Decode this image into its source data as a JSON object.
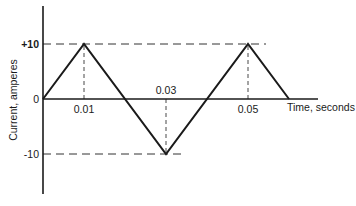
{
  "chart_data": {
    "type": "line",
    "title": "",
    "xlabel": "Time, seconds",
    "ylabel": "Current, amperes",
    "x": [
      0,
      0.01,
      0.03,
      0.05,
      0.06
    ],
    "series": [
      {
        "name": "Current (triangular wave)",
        "values": [
          0,
          10,
          -10,
          10,
          0
        ]
      }
    ],
    "x_tick_labels": [
      {
        "value": 0.01,
        "label": "0.01",
        "position": "below"
      },
      {
        "value": 0.03,
        "label": "0.03",
        "position": "above"
      },
      {
        "value": 0.05,
        "label": "0.05",
        "position": "below"
      }
    ],
    "y_tick_labels": [
      {
        "value": 10,
        "label": "+10"
      },
      {
        "value": 0,
        "label": "0"
      },
      {
        "value": -10,
        "label": "-10"
      }
    ],
    "reference_lines": {
      "horizontal_dashed": [
        10,
        -10
      ],
      "vertical_dashed": [
        0.01,
        0.03,
        0.05
      ]
    },
    "xlim": [
      0,
      0.066
    ],
    "ylim": [
      -18,
      17
    ],
    "grid": false,
    "legend": "none",
    "colors": {
      "line": "#1a1a1a",
      "axis": "#1a1a1a",
      "dashed": "#333333",
      "background": "#ffffff"
    }
  }
}
